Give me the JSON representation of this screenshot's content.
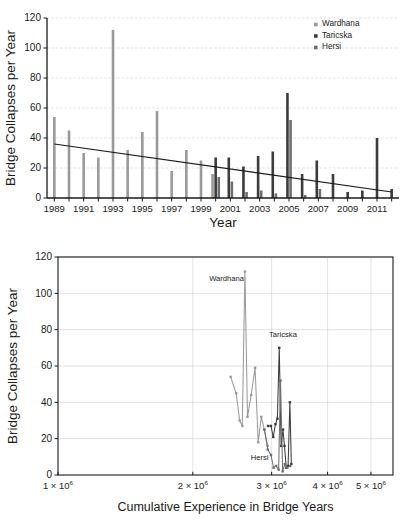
{
  "colors": {
    "wardhana": "#9a9a9a",
    "taricska": "#3c3c3c",
    "hersi": "#6f6f6f",
    "axis": "#1a1a1a",
    "grid": "#c9c9d4"
  },
  "legend": {
    "items": [
      {
        "label": "Wardhana",
        "color": "#9a9a9a"
      },
      {
        "label": "Taricska",
        "color": "#3c3c3c"
      },
      {
        "label": "Hersi",
        "color": "#6f6f6f"
      }
    ]
  },
  "chart_data": [
    {
      "id": "bar-chart",
      "type": "bar",
      "title": "",
      "xlabel": "Year",
      "ylabel": "Bridge Collapses per Year",
      "ylim": [
        0,
        120
      ],
      "yticks": [
        0,
        20,
        40,
        60,
        80,
        100,
        120
      ],
      "grid": true,
      "legend_position": "top-right",
      "categories": [
        1989,
        1990,
        1991,
        1992,
        1993,
        1994,
        1995,
        1996,
        1997,
        1998,
        1999,
        2000,
        2001,
        2002,
        2003,
        2004,
        2005,
        2006,
        2007,
        2008,
        2009,
        2010,
        2011,
        2012
      ],
      "xtick_labels": [
        "1989",
        "1991",
        "1993",
        "1995",
        "1997",
        "1999",
        "2001",
        "2003",
        "2005",
        "2007",
        "2009",
        "2011"
      ],
      "xtick_years": [
        1989,
        1991,
        1993,
        1995,
        1997,
        1999,
        2001,
        2003,
        2005,
        2007,
        2009,
        2011
      ],
      "series": [
        {
          "name": "Wardhana",
          "color": "#9a9a9a",
          "values": [
            54,
            45,
            30,
            27,
            112,
            32,
            44,
            58,
            18,
            32,
            25,
            16,
            null,
            null,
            null,
            null,
            null,
            null,
            null,
            null,
            null,
            null,
            null,
            null
          ]
        },
        {
          "name": "Taricska",
          "color": "#3c3c3c",
          "values": [
            null,
            null,
            null,
            null,
            null,
            null,
            null,
            null,
            null,
            null,
            null,
            27,
            27,
            21,
            28,
            31,
            70,
            16,
            25,
            16,
            4,
            5,
            40,
            6
          ]
        },
        {
          "name": "Hersi",
          "color": "#6f6f6f",
          "values": [
            null,
            null,
            null,
            null,
            null,
            null,
            null,
            null,
            null,
            null,
            null,
            14,
            11,
            4,
            5,
            3,
            52,
            2,
            6,
            null,
            null,
            null,
            null,
            null
          ]
        }
      ],
      "trendline": {
        "label": "linear trend",
        "start": {
          "x": 1989,
          "y": 36
        },
        "end": {
          "x": 2012,
          "y": 4
        }
      }
    },
    {
      "id": "scatter-chart",
      "type": "line",
      "title": "",
      "xlabel": "Cumulative Experience in Bridge Years",
      "ylabel": "Bridge Collapses per Year",
      "xscale": "log",
      "xlim": [
        1000000,
        5600000
      ],
      "ylim": [
        0,
        120
      ],
      "yticks": [
        0,
        20,
        40,
        60,
        80,
        100,
        120
      ],
      "xticks": [
        1000000,
        2000000,
        3000000,
        4000000,
        5000000
      ],
      "xtick_labels": [
        "1 × 10",
        "2 × 10",
        "3 × 10",
        "4 × 10",
        "5 × 10"
      ],
      "xtick_exponent": "6",
      "grid": true,
      "annotations": [
        {
          "text": "Wardhana",
          "x": 2380000,
          "y": 107
        },
        {
          "text": "Taricska",
          "x": 3180000,
          "y": 76
        },
        {
          "text": "Hersi",
          "x": 2820000,
          "y": 8
        }
      ],
      "series": [
        {
          "name": "Wardhana",
          "color": "#9a9a9a",
          "points": [
            {
              "x": 2430000,
              "y": 54
            },
            {
              "x": 2500000,
              "y": 45
            },
            {
              "x": 2545000,
              "y": 30
            },
            {
              "x": 2580000,
              "y": 27
            },
            {
              "x": 2615000,
              "y": 112
            },
            {
              "x": 2650000,
              "y": 32
            },
            {
              "x": 2700000,
              "y": 44
            },
            {
              "x": 2755000,
              "y": 59
            },
            {
              "x": 2800000,
              "y": 18
            },
            {
              "x": 2845000,
              "y": 32
            },
            {
              "x": 2890000,
              "y": 25
            },
            {
              "x": 2940000,
              "y": 16
            }
          ]
        },
        {
          "name": "Taricska",
          "color": "#3c3c3c",
          "points": [
            {
              "x": 2945000,
              "y": 27
            },
            {
              "x": 2990000,
              "y": 27
            },
            {
              "x": 3025000,
              "y": 21
            },
            {
              "x": 3060000,
              "y": 28
            },
            {
              "x": 3090000,
              "y": 31
            },
            {
              "x": 3120000,
              "y": 70
            },
            {
              "x": 3150000,
              "y": 16
            },
            {
              "x": 3180000,
              "y": 25
            },
            {
              "x": 3205000,
              "y": 16
            },
            {
              "x": 3235000,
              "y": 4
            },
            {
              "x": 3265000,
              "y": 5
            },
            {
              "x": 3295000,
              "y": 40
            },
            {
              "x": 3320000,
              "y": 6
            }
          ]
        },
        {
          "name": "Hersi",
          "color": "#6f6f6f",
          "points": [
            {
              "x": 2890000,
              "y": 25
            },
            {
              "x": 2940000,
              "y": 14
            },
            {
              "x": 2990000,
              "y": 11
            },
            {
              "x": 3030000,
              "y": 4
            },
            {
              "x": 3070000,
              "y": 5
            },
            {
              "x": 3110000,
              "y": 3
            },
            {
              "x": 3140000,
              "y": 52
            },
            {
              "x": 3175000,
              "y": 2
            },
            {
              "x": 3210000,
              "y": 6
            },
            {
              "x": 3250000,
              "y": 4
            },
            {
              "x": 3300000,
              "y": 5
            }
          ]
        }
      ]
    }
  ]
}
